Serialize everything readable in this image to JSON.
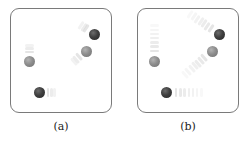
{
  "figure": {
    "panels": [
      {
        "label": "(a)",
        "description": "Particles with short motion trails (slow)",
        "particles": [
          {
            "shade": "dark",
            "x": 94,
            "y": 34,
            "trail_direction": "up-left",
            "trail_length": "short"
          },
          {
            "shade": "light",
            "x": 86,
            "y": 51,
            "trail_direction": "down-left",
            "trail_length": "short"
          },
          {
            "shade": "light",
            "x": 29,
            "y": 61,
            "trail_direction": "up",
            "trail_length": "short"
          },
          {
            "shade": "dark",
            "x": 39,
            "y": 92,
            "trail_direction": "right",
            "trail_length": "short"
          }
        ]
      },
      {
        "label": "(b)",
        "description": "Particles with long motion trails (fast)",
        "particles": [
          {
            "shade": "dark",
            "x": 219,
            "y": 34,
            "trail_direction": "up-left",
            "trail_length": "long"
          },
          {
            "shade": "light",
            "x": 212,
            "y": 51,
            "trail_direction": "down-left",
            "trail_length": "long"
          },
          {
            "shade": "light",
            "x": 154,
            "y": 61,
            "trail_direction": "up",
            "trail_length": "long"
          },
          {
            "shade": "dark",
            "x": 166,
            "y": 92,
            "trail_direction": "right",
            "trail_length": "long"
          }
        ]
      }
    ],
    "colors": {
      "border": "#7a7a7a",
      "dark_particle": "#3f3f3f",
      "light_particle": "#8e8e8e",
      "trail": "#d0d0d0"
    }
  }
}
